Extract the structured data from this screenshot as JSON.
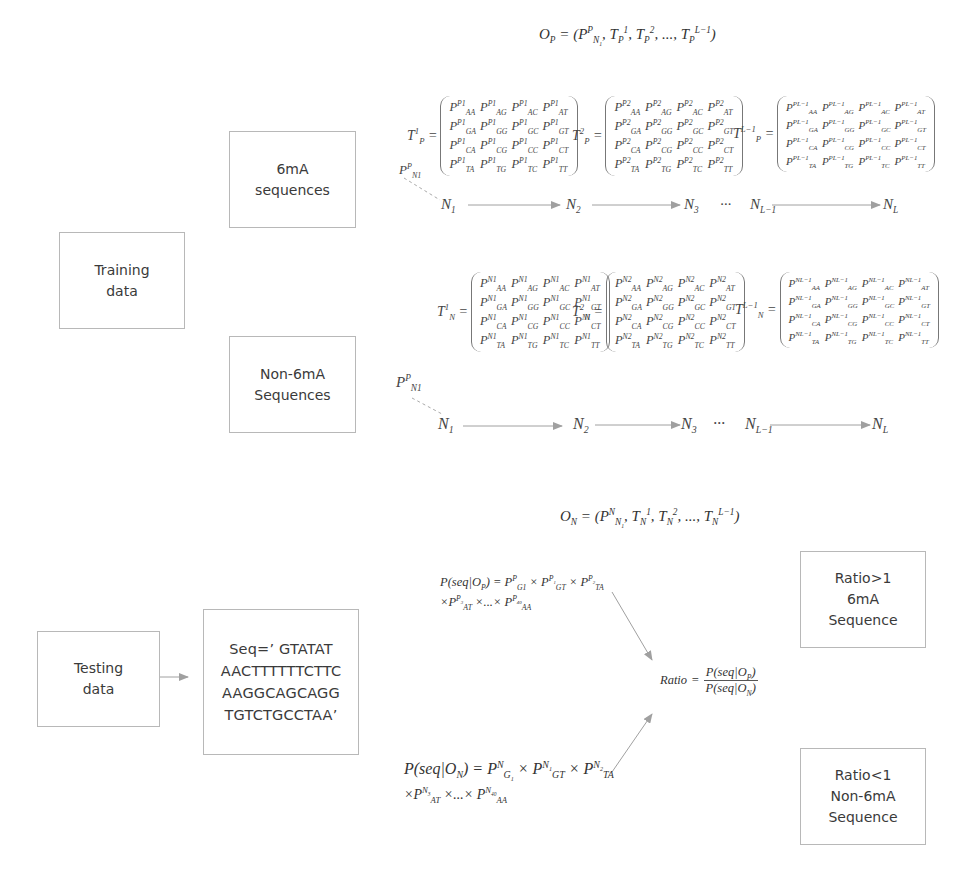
{
  "title_formulas": {
    "positive_model": "O_P = (P^P_N1, T^1_P, T^2_P, ..., T^(L-1)_P)",
    "negative_model": "O_N = (P^N_N1, T^1_N, T^2_N, ..., T^(L-1)_N)"
  },
  "boxes": {
    "training": [
      "Training",
      "data"
    ],
    "positive_seq": [
      "6mA",
      "sequences"
    ],
    "negative_seq": [
      "Non-6mA",
      "Sequences"
    ],
    "testing": [
      "Testing",
      "data"
    ],
    "sequence": [
      "Seq=’  GTATAT",
      "AACTTTTTTCTTC",
      "AAGGCAGCAGG",
      "TGTCTGCCTAA’"
    ],
    "result_positive": [
      "Ratio>1",
      "6mA",
      "Sequence"
    ],
    "result_negative": [
      "Ratio<1",
      "Non-6mA",
      "Sequence"
    ]
  },
  "nucleotide_pairs": [
    [
      "AA",
      "AG",
      "AC",
      "AT"
    ],
    [
      "GA",
      "GG",
      "GC",
      "GT"
    ],
    [
      "CA",
      "CG",
      "CC",
      "CT"
    ],
    [
      "TA",
      "TG",
      "TC",
      "TT"
    ]
  ],
  "matrices": {
    "positive": [
      {
        "name": "T",
        "sub": "P",
        "sup": "1",
        "state": "P1"
      },
      {
        "name": "T",
        "sub": "P",
        "sup": "2",
        "state": "P2"
      },
      {
        "name": "T",
        "sub": "P",
        "sup": "L−1",
        "state": "PL−1"
      }
    ],
    "negative": [
      {
        "name": "T",
        "sub": "N",
        "sup": "1",
        "state": "N1"
      },
      {
        "name": "T",
        "sub": "N",
        "sup": "2",
        "state": "N2"
      },
      {
        "name": "T",
        "sub": "N",
        "sup": "L−1",
        "state": "NL−1"
      }
    ]
  },
  "chains": {
    "initial_label": {
      "base": "P",
      "sub": "N1",
      "sup": "P"
    },
    "nodes": [
      {
        "base": "N",
        "sub": "1"
      },
      {
        "base": "N",
        "sub": "2"
      },
      {
        "base": "N",
        "sub": "3"
      },
      {
        "base": "N",
        "sub": "L−1"
      },
      {
        "base": "N",
        "sub": "L"
      }
    ],
    "ellipsis": "···"
  },
  "probabilities": {
    "positive_line1": "P(seq|O_P) = P^P_G1 × P^P1_GT × P^P2_TA",
    "positive_line2": "× P^P3_AT × ... × P^P40_AA",
    "negative_line1": "P(seq|O_N) = P^N_G1 × P^N1_GT × P^N2_TA",
    "negative_line2": "× P^N3_AT × ... × P^N40_AA",
    "ratio_label": "Ratio",
    "ratio_numerator": "P(seq|O_P)",
    "ratio_denominator": "P(seq|O_N)"
  },
  "colors": {
    "box_border": "#b8b8b8",
    "arrow": "#a0a0a0",
    "text": "#333333"
  }
}
